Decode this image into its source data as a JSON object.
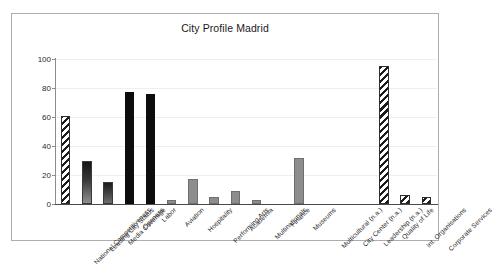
{
  "chart_data": {
    "type": "bar",
    "title": "City Profile Madrid",
    "xlabel": "",
    "ylabel": "",
    "ylim": [
      0,
      100
    ],
    "yticks": [
      0,
      20,
      40,
      60,
      80,
      100
    ],
    "grid": true,
    "legend": false,
    "categories": [
      "National Competitiveness",
      "Leading City Status",
      "Media Coverage",
      "Openess",
      "Labor",
      "Aviation",
      "Hospitality",
      "Performing Arts",
      "Academia",
      "Multinationals",
      "Finance",
      "Museums",
      "Multicultural (n.a.)",
      "City Center (n.a.)",
      "Leadership (n.a.)",
      "Quality of Life",
      "Int. Organisations",
      "Corporate Services"
    ],
    "values": [
      61,
      30,
      15,
      77,
      76,
      3,
      17,
      5,
      9,
      3,
      0,
      32,
      0,
      0,
      0,
      95,
      6,
      5
    ],
    "bar_styles": [
      "hatch",
      "gradient-dark",
      "gradient-mid",
      "solid-dark",
      "solid-dark",
      "gray",
      "gray",
      "gray",
      "gray",
      "gray",
      "none",
      "gray",
      "none",
      "none",
      "none",
      "hatch",
      "hatch",
      "hatch"
    ]
  },
  "colors": {
    "frame_border": "#aeaeae",
    "axis": "#4a4a4a",
    "gridline": "#f0eef0",
    "bar_dark": "#0d0d0d",
    "bar_gray": "#8d8d8d",
    "text": "#1f1f1f",
    "background": "#ffffff"
  }
}
